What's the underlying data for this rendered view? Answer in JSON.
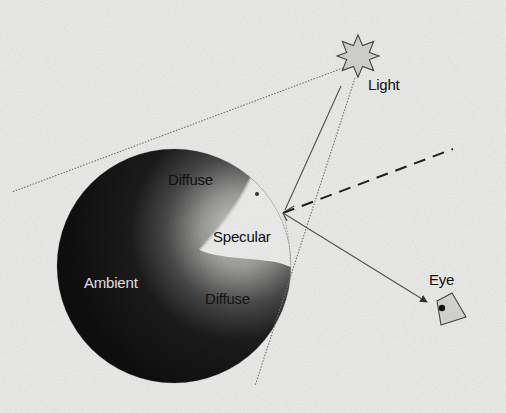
{
  "figure": {
    "title": "",
    "labels": {
      "light": "Light",
      "diffuse_top": "Diffuse",
      "specular": "Specular",
      "ambient": "Ambient",
      "diffuse_bottom": "Diffuse",
      "eye": "Eye"
    },
    "colors": {
      "background": "#eeeeec",
      "sphere_dark": "#111111",
      "sphere_mid": "#6a6a6a",
      "specular_highlight": "#f2f2f0",
      "light_fill": "#d8d8d8",
      "line": "#444444",
      "ambient_text": "#e6e6e6",
      "dark_text": "#111111"
    },
    "elements": {
      "light_source": {
        "shape": "8-point-star",
        "cx": 358,
        "cy": 56
      },
      "sphere": {
        "cx": 174,
        "cy": 266,
        "r": 117
      },
      "reflection_point": {
        "x": 283,
        "y": 213
      },
      "eye": {
        "pupil_x": 442,
        "pupil_y": 308
      }
    },
    "rays": [
      {
        "name": "incident-ray",
        "style": "solid",
        "from": "light",
        "to": "reflection_point"
      },
      {
        "name": "reflected-ray",
        "style": "dashed",
        "from": "reflection_point",
        "to": "upper-right"
      },
      {
        "name": "view-ray",
        "style": "solid",
        "from": "reflection_point",
        "to": "eye"
      },
      {
        "name": "light-tangent-left",
        "style": "dotted",
        "from": "light",
        "to": "left-edge"
      },
      {
        "name": "light-tangent-right",
        "style": "dotted",
        "from": "light",
        "to": "bottom"
      }
    ]
  }
}
